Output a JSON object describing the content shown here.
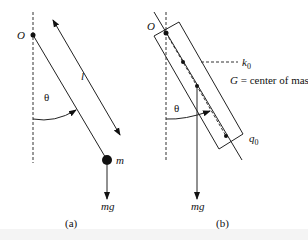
{
  "panel_a": {
    "pivot_label": "O",
    "length_label": "l",
    "angle_label": "θ",
    "mass_label": "m",
    "force_label": "mg",
    "caption": "(a)"
  },
  "panel_b": {
    "pivot_label": "O",
    "k_label": "k",
    "k_sub": "0",
    "g_label": "G",
    "g_desc": " = center of mass",
    "q_label": "q",
    "q_sub": "0",
    "angle_label": "θ",
    "force_label": "mg",
    "caption": "(b)"
  }
}
